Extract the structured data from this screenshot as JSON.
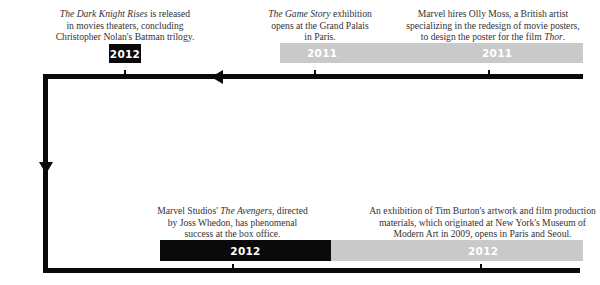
{
  "timeline": {
    "top_row": [
      {
        "title_italic": "The Dark Knight Rises",
        "text_after_title": " is released",
        "line2": "in movies theaters, concluding",
        "line3": "Christopher Nolan's Batman trilogy.",
        "year": "2012",
        "box_color": "#0a0a0a"
      },
      {
        "title_italic": "The Game Story",
        "text_after_title": " exhibition",
        "line2": "opens at the Grand Palais",
        "line3": "in Paris.",
        "year": "2011",
        "box_color": "#c9c9c9"
      },
      {
        "line1": "Marvel hires Olly Moss, a British artist",
        "line2": "specializing in the redesign of movie posters,",
        "line3_before": "to design the poster for the film ",
        "line3_italic": "Thor",
        "line3_after": ".",
        "year": "2011",
        "box_color": "#c9c9c9"
      }
    ],
    "bottom_row": [
      {
        "line1_before": "Marvel Studios' ",
        "line1_italic": "The Avengers",
        "line1_after": ", directed",
        "line2": "by Joss Whedon, has phenomenal",
        "line3": "success at the box office.",
        "year": "2012",
        "box_color": "#0a0a0a"
      },
      {
        "line1": "An exhibition of Tim Burton's artwork and film production",
        "line2": "materials, which originated at New York's Museum of",
        "line3": "Modern Art in 2009, opens in Paris and Seoul.",
        "year": "2012",
        "box_color": "#c9c9c9"
      }
    ],
    "colors": {
      "line": "#0a0a0a",
      "accent_black": "#0a0a0a",
      "accent_gray": "#c9c9c9",
      "text": "#333333"
    }
  }
}
